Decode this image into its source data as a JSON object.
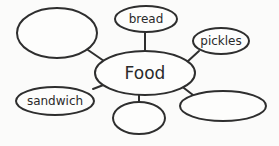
{
  "diagram": {
    "type": "concept-web",
    "center": {
      "label": "Food"
    },
    "nodes": [
      {
        "id": "top-left",
        "label": ""
      },
      {
        "id": "top",
        "label": "bread"
      },
      {
        "id": "right-top",
        "label": "pickles"
      },
      {
        "id": "left-bottom",
        "label": "sandwich"
      },
      {
        "id": "bottom",
        "label": ""
      },
      {
        "id": "right-bottom",
        "label": ""
      }
    ]
  }
}
